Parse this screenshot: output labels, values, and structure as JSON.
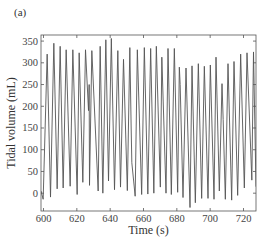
{
  "panel_label": "(a)",
  "chart_data": {
    "type": "line",
    "title": "",
    "xlabel": "Time (s)",
    "ylabel": "Tidal volume (mL)",
    "xlim": [
      598.5,
      727.5
    ],
    "ylim": [
      -41,
      364
    ],
    "xticks": [
      600,
      620,
      640,
      660,
      680,
      700,
      720
    ],
    "yticks": [
      0,
      50,
      100,
      150,
      200,
      250,
      300,
      350
    ],
    "grid": false,
    "legend": null,
    "line_color": "#555555",
    "series": [
      {
        "name": "Tidal volume",
        "points": [
          [
            598.5,
            5
          ],
          [
            599.8,
            -14
          ],
          [
            602.2,
            320
          ],
          [
            604.2,
            -9
          ],
          [
            606.2,
            345
          ],
          [
            608.2,
            10
          ],
          [
            610.0,
            338
          ],
          [
            611.8,
            12
          ],
          [
            613.6,
            330
          ],
          [
            616.0,
            16
          ],
          [
            617.6,
            330
          ],
          [
            620.2,
            -3
          ],
          [
            621.4,
            323
          ],
          [
            623.6,
            25
          ],
          [
            625.2,
            330
          ],
          [
            627.0,
            190
          ],
          [
            627.4,
            250
          ],
          [
            627.6,
            18
          ],
          [
            629.0,
            328
          ],
          [
            632.8,
            5
          ],
          [
            634.0,
            338
          ],
          [
            635.6,
            0
          ],
          [
            637.4,
            353
          ],
          [
            639.0,
            28
          ],
          [
            640.7,
            356
          ],
          [
            642.6,
            8
          ],
          [
            644.6,
            328
          ],
          [
            646.2,
            14
          ],
          [
            648.0,
            308
          ],
          [
            650.3,
            6
          ],
          [
            651.8,
            335
          ],
          [
            652.6,
            150
          ],
          [
            653.0,
            70
          ],
          [
            655.0,
            -7
          ],
          [
            656.3,
            330
          ],
          [
            658.9,
            -3
          ],
          [
            660.5,
            335
          ],
          [
            662.6,
            -2
          ],
          [
            664.3,
            333
          ],
          [
            666.2,
            0
          ],
          [
            667.7,
            338
          ],
          [
            670.1,
            14
          ],
          [
            671.0,
            313
          ],
          [
            673.5,
            0
          ],
          [
            674.7,
            333
          ],
          [
            676.7,
            -3
          ],
          [
            678.5,
            333
          ],
          [
            680.5,
            2
          ],
          [
            681.5,
            290
          ],
          [
            682.0,
            250
          ],
          [
            683.7,
            -10
          ],
          [
            685.5,
            288
          ],
          [
            687.9,
            -33
          ],
          [
            689.1,
            293
          ],
          [
            691.1,
            -22
          ],
          [
            692.9,
            298
          ],
          [
            694.9,
            -12
          ],
          [
            696.5,
            292
          ],
          [
            698.7,
            -12
          ],
          [
            700.1,
            295
          ],
          [
            702.3,
            -14
          ],
          [
            703.5,
            313
          ],
          [
            705.5,
            5
          ],
          [
            707.1,
            252
          ],
          [
            707.8,
            170
          ],
          [
            709.1,
            -14
          ],
          [
            710.7,
            298
          ],
          [
            712.9,
            -16
          ],
          [
            714.3,
            303
          ],
          [
            716.5,
            -5
          ],
          [
            718.3,
            320
          ],
          [
            720.5,
            12
          ],
          [
            722.1,
            323
          ],
          [
            725.0,
            30
          ],
          [
            726.0,
            325
          ],
          [
            727.5,
            15
          ]
        ]
      }
    ]
  }
}
